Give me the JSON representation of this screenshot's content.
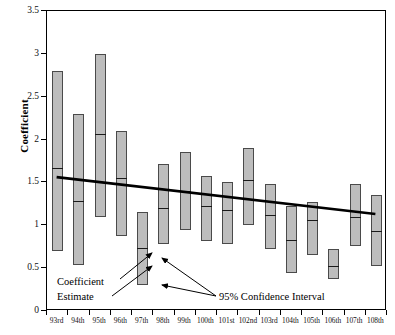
{
  "chart_data": {
    "type": "bar",
    "title": "",
    "xlabel": "",
    "ylabel": "Coefficient",
    "ylim": [
      0,
      3.5
    ],
    "yticks": [
      0,
      0.5,
      1,
      1.5,
      2,
      2.5,
      3,
      3.5
    ],
    "ytick_labels": [
      "0",
      "0.5",
      "1",
      "1.5",
      "2",
      "2.5",
      "3",
      "3.5"
    ],
    "grid": false,
    "legend": "none",
    "categories": [
      "93rd",
      "94th",
      "95th",
      "96th",
      "97th",
      "98th",
      "99th",
      "100th",
      "101st",
      "102nd",
      "103rd",
      "104th",
      "105th",
      "106th",
      "107th",
      "108th"
    ],
    "series": [
      {
        "name": "Coefficient Estimate",
        "values": [
          1.67,
          1.28,
          2.07,
          1.55,
          0.73,
          1.2,
          1.4,
          1.23,
          1.18,
          1.53,
          1.12,
          0.83,
          1.06,
          0.53,
          1.1,
          0.93
        ]
      },
      {
        "name": "95% Confidence Interval Lower",
        "values": [
          0.7,
          0.54,
          1.1,
          0.88,
          0.3,
          0.78,
          0.95,
          0.82,
          0.78,
          1.0,
          0.72,
          0.44,
          0.65,
          0.37,
          0.76,
          0.52
        ]
      },
      {
        "name": "95% Confidence Interval Upper",
        "values": [
          2.8,
          2.3,
          3.0,
          2.1,
          1.15,
          1.72,
          1.85,
          1.58,
          1.5,
          1.9,
          1.48,
          1.22,
          1.27,
          0.72,
          1.48,
          1.35
        ]
      }
    ],
    "trend_line": {
      "x_start_category": "93rd",
      "y_start": 1.55,
      "x_end_category": "108th",
      "y_end": 1.12
    }
  },
  "annotations": {
    "coefficient_estimate_line1": "Coefficient",
    "coefficient_estimate_line2": "Estimate",
    "confidence_interval": "95% Confidence Interval"
  },
  "axes": {
    "y_title": "Coefficient"
  }
}
